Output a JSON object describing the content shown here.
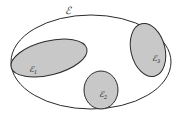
{
  "diagram": {
    "colors": {
      "background": "#ffffff",
      "stroke": "#2a2a2a",
      "fill": "#c8c8c8"
    },
    "outer_set": {
      "label": "ℰ",
      "cx": 91,
      "cy": 62,
      "rx": 80,
      "ry": 47
    },
    "subsets": [
      {
        "label": "ℰ",
        "sub": "1",
        "cx": 49,
        "cy": 58,
        "rx": 39,
        "ry": 17,
        "rotate": -14
      },
      {
        "label": "ℰ",
        "sub": "2",
        "cx": 101,
        "cy": 94,
        "rx": 17,
        "ry": 19,
        "rotate": 0
      },
      {
        "label": "ℰ",
        "sub": "3",
        "cx": 150,
        "cy": 50,
        "rx": 17,
        "ry": 27,
        "rotate": -14
      }
    ]
  }
}
